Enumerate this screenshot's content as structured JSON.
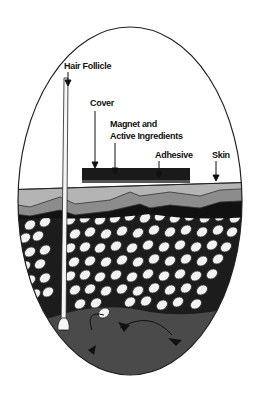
{
  "diagram": {
    "labels": {
      "hair_follicle": "Hair Follicle",
      "cover": "Cover",
      "magnet_line1": "Magnet and",
      "magnet_line2": "Active Ingredients",
      "adhesive": "Adhesive",
      "skin": "Skin"
    },
    "colors": {
      "background": "#ffffff",
      "outline": "#222222",
      "patch": "#1a1a1a",
      "epidermis": "#b4b4b4",
      "dermis_band": "#8c8c8c",
      "dark_band": "#111111",
      "cells": "#f2f2f2",
      "deep_tissue": "#4a4a4a"
    }
  }
}
